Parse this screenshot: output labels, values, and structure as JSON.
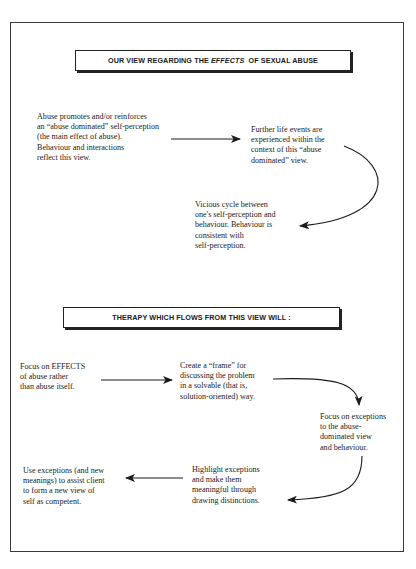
{
  "section1": {
    "header": {
      "prefix": "OUR VIEW REGARDING THE ",
      "emphasis": "EFFECTS",
      "suffix": "  OF SEXUAL ABUSE"
    },
    "nodes": [
      {
        "id": "abuse-promotes",
        "text": "Abuse promotes and/or reinforces\nan “abuse dominated” self-perception\n(the main effect of abuse).\nBehaviour and interactions\nreflect this view."
      },
      {
        "id": "further-life-events",
        "text": "Further life events are\nexperienced within the\ncontext of this “abuse\ndominated” view."
      },
      {
        "id": "vicious-cycle",
        "text": "Vicious cycle between\none's self-perception and\nbehaviour. Behaviour is\nconsistent with\nself-perception."
      }
    ]
  },
  "section2": {
    "header": {
      "text": "THERAPY WHICH FLOWS FROM THIS VIEW WILL :"
    },
    "nodes": [
      {
        "id": "focus-effects",
        "text": "Focus on EFFECTS\nof abuse rather\nthan abuse itself."
      },
      {
        "id": "create-frame",
        "text": "Create a “frame” for\ndiscussing the problem\nin a solvable (that is,\nsolution-oriented) way."
      },
      {
        "id": "focus-exceptions",
        "text": "Focus on exceptions\nto the abuse-\ndominated view\nand behaviour."
      },
      {
        "id": "highlight-exceptions",
        "text": "Highlight exceptions\nand make them\nmeaningful through\ndrawing distinctions."
      },
      {
        "id": "use-exceptions",
        "text": "Use exceptions (and new\nmeanings) to assist client\nto form a new view of\nself as competent."
      }
    ]
  },
  "colors": {
    "line": "#1a1a1a",
    "frame": "#3a3a3a",
    "background": "#ffffff"
  }
}
